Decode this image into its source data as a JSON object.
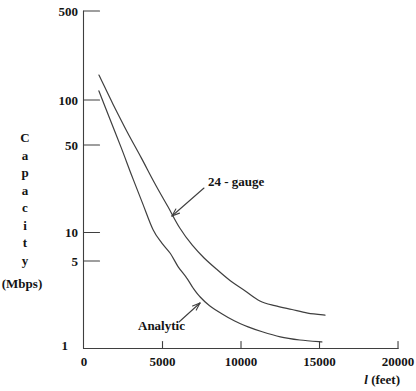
{
  "figure": {
    "background": "#ffffff",
    "line_color": "#3f3f3f",
    "text_color": "#141414"
  },
  "chart_data": {
    "type": "line",
    "title": "",
    "xlabel": {
      "variable": "l",
      "unit": "(feet)"
    },
    "ylabel": {
      "word": "Capacity",
      "unit": "(Mbps)"
    },
    "x_scale": "linear",
    "y_scale": "log",
    "grid": false,
    "legend": "inline-annotations",
    "xlim": [
      0,
      20000
    ],
    "ylim": [
      1,
      500
    ],
    "x_ticks": [
      0,
      5000,
      10000,
      15000,
      20000
    ],
    "y_ticks": [
      1,
      5,
      10,
      50,
      100,
      500
    ],
    "series": [
      {
        "name": "24-gauge",
        "label": "24 - gauge",
        "points": [
          [
            950,
            154
          ],
          [
            1850,
            90
          ],
          [
            2750,
            54
          ],
          [
            3650,
            33.5
          ],
          [
            4500,
            21
          ],
          [
            5350,
            13.6
          ],
          [
            6100,
            9.2
          ],
          [
            6900,
            6.7
          ],
          [
            7650,
            5.3
          ],
          [
            8450,
            4.3
          ],
          [
            9300,
            3.5
          ],
          [
            10250,
            2.9
          ],
          [
            11200,
            2.4
          ],
          [
            12150,
            2.2
          ],
          [
            13250,
            2.05
          ],
          [
            14250,
            1.92
          ],
          [
            15350,
            1.85
          ]
        ]
      },
      {
        "name": "Analytic",
        "label": "Analytic",
        "points": [
          [
            950,
            115
          ],
          [
            1650,
            68.5
          ],
          [
            2350,
            41
          ],
          [
            3050,
            24
          ],
          [
            3750,
            14.3
          ],
          [
            4400,
            8.9
          ],
          [
            4950,
            7.0
          ],
          [
            5500,
            5.75
          ],
          [
            6000,
            4.5
          ],
          [
            6550,
            3.66
          ],
          [
            6950,
            3.05
          ],
          [
            7400,
            2.58
          ],
          [
            8000,
            2.2
          ],
          [
            8800,
            1.89
          ],
          [
            9600,
            1.66
          ],
          [
            10450,
            1.49
          ],
          [
            11350,
            1.36
          ],
          [
            12500,
            1.24
          ],
          [
            13750,
            1.17
          ],
          [
            15150,
            1.13
          ]
        ]
      }
    ],
    "annotations": [
      {
        "text": "24 - gauge",
        "target_series": "24-gauge",
        "label_px": [
          208,
          186
        ],
        "arrow_from_px": [
          204,
          188
        ],
        "arrow_to_px": [
          172,
          216
        ]
      },
      {
        "text": "Analytic",
        "target_series": "Analytic",
        "label_px": [
          138,
          330
        ],
        "arrow_from_px": [
          179,
          322
        ],
        "arrow_to_px": [
          200,
          303
        ]
      }
    ]
  }
}
